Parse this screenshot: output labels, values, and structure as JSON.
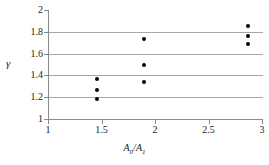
{
  "chart_data": {
    "type": "scatter",
    "title": "",
    "xlabel": "A0/A1",
    "xlabel_parts": {
      "base1": "A",
      "sub1": "0",
      "slash": "/",
      "base2": "A",
      "sub2": "1"
    },
    "ylabel": "γ",
    "xlim": [
      1,
      3
    ],
    "ylim": [
      1,
      2
    ],
    "xticks": [
      1,
      1.5,
      2,
      2.5,
      3
    ],
    "xtick_labels": [
      "1",
      "1.5",
      "2",
      "2.5",
      "3"
    ],
    "yticks": [
      1,
      1.2,
      1.4,
      1.6,
      1.8,
      2
    ],
    "ytick_labels": [
      "1",
      "1.2",
      "1.4",
      "1.6",
      "1.8",
      "2"
    ],
    "grid": "horizontal",
    "gridlines_y": [
      1.2,
      1.4,
      1.6,
      1.8
    ],
    "legend": "none",
    "marker": "filled-circle",
    "marker_color": "#000000",
    "series": [
      {
        "name": "data",
        "points": [
          {
            "x": 1.46,
            "y": 1.37
          },
          {
            "x": 1.46,
            "y": 1.27
          },
          {
            "x": 1.46,
            "y": 1.18
          },
          {
            "x": 1.9,
            "y": 1.73
          },
          {
            "x": 1.9,
            "y": 1.5
          },
          {
            "x": 1.9,
            "y": 1.34
          },
          {
            "x": 2.87,
            "y": 1.85
          },
          {
            "x": 2.87,
            "y": 1.76
          },
          {
            "x": 2.87,
            "y": 1.69
          }
        ]
      }
    ]
  }
}
